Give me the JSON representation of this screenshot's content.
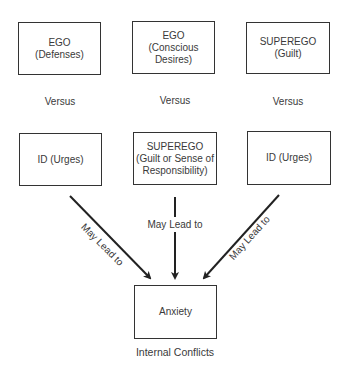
{
  "top_row": [
    {
      "title": "EGO",
      "subtitle": "(Defenses)"
    },
    {
      "title": "EGO",
      "subtitle": "(Conscious",
      "subtitle2": "Desires)"
    },
    {
      "title": "SUPEREGO",
      "subtitle": "(Guilt)"
    }
  ],
  "versus_labels": [
    "Versus",
    "Versus",
    "Versus"
  ],
  "bottom_row": [
    {
      "title": "ID (Urges)"
    },
    {
      "title": "SUPEREGO",
      "subtitle": "(Guilt or Sense of",
      "subtitle2": "Responsibility)"
    },
    {
      "title": "ID (Urges)"
    }
  ],
  "arrows": {
    "left_label": "May Lead to",
    "center_label": "May Lead to",
    "right_label": "May Lead to"
  },
  "result": {
    "title": "Anxiety"
  },
  "caption": "Internal Conflicts"
}
